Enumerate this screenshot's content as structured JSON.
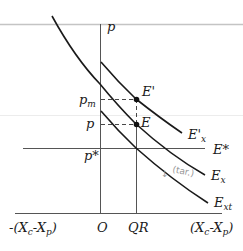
{
  "diagram": {
    "type": "economics-supply-demand-diagram",
    "axes": {
      "vertical_label": "p",
      "horizontal_left_label": "-(X",
      "horizontal_left_sub1": "c",
      "horizontal_left_mid": "-X",
      "horizontal_left_sub2": "p",
      "horizontal_left_close": ")",
      "horizontal_right_label": "(X",
      "horizontal_right_sub1": "c",
      "horizontal_right_mid": "-X",
      "horizontal_right_sub2": "p",
      "horizontal_right_close": ")",
      "origin_label": "O",
      "qr_label": "QR"
    },
    "price_labels": {
      "pm_base": "p",
      "pm_sub": "m",
      "p": "p",
      "pstar": "p*"
    },
    "points": {
      "e_prime": "E'",
      "e": "E"
    },
    "curves": {
      "ex_prime_base": "E'",
      "ex_prime_sub": "x",
      "estar": "E*",
      "ex_base": "E",
      "ex_sub": "x",
      "ext_base": "E",
      "ext_sub": "xt"
    },
    "annotation": {
      "arrow": "↓",
      "text": "(tar.)"
    },
    "colors": {
      "ink": "#1a1a1a",
      "axis": "#555555",
      "rule": "#c8c8c8",
      "faint_rule": "#e6e6e6",
      "annotation": "#9a9a9a"
    }
  }
}
